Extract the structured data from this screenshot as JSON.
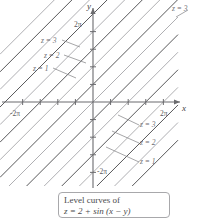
{
  "figure": {
    "background_color": "#ffffff"
  },
  "axes": {
    "x_axis_label": "x",
    "y_axis_label": "y",
    "x_ticks": [
      {
        "label": "-2π",
        "value": -6.2832
      },
      {
        "label": "",
        "value": -4.7124
      },
      {
        "label": "",
        "value": -3.1416
      },
      {
        "label": "",
        "value": -1.5708
      },
      {
        "label": "",
        "value": 1.5708
      },
      {
        "label": "",
        "value": 3.1416
      },
      {
        "label": "",
        "value": 4.7124
      },
      {
        "label": "2π",
        "value": 6.2832
      }
    ],
    "y_ticks": [
      {
        "label": "2π",
        "value": 6.2832
      },
      {
        "label": "",
        "value": 4.7124
      },
      {
        "label": "",
        "value": 3.1416
      },
      {
        "label": "",
        "value": 1.5708
      },
      {
        "label": "",
        "value": -1.5708
      },
      {
        "label": "",
        "value": -3.1416
      },
      {
        "label": "",
        "value": -4.7124
      },
      {
        "label": "-2π",
        "value": -6.2832
      }
    ],
    "axis_color": "#6b6b6e"
  },
  "contour_labels": {
    "upper_left": [
      {
        "text": "z = 3",
        "x": 41,
        "y": 40
      },
      {
        "text": "z = 2",
        "x": 44,
        "y": 55
      },
      {
        "text": "z = 1",
        "x": 33,
        "y": 68
      }
    ],
    "lower_right": [
      {
        "text": "z = 3",
        "x": 140,
        "y": 124
      },
      {
        "text": "z = 2",
        "x": 140,
        "y": 142
      },
      {
        "text": "z = 1",
        "x": 140,
        "y": 161
      }
    ],
    "top_right": [
      {
        "text": "z = 3",
        "x": 172,
        "y": 8
      }
    ]
  },
  "caption": {
    "line1": "Level curves of",
    "line2": "z = 2 + sin (x − y)"
  },
  "chart_data": {
    "type": "line",
    "function": "z = 2 + sin(x - y)",
    "xlabel": "x",
    "ylabel": "y",
    "xlim": [
      -8.6,
      8.6
    ],
    "ylim": [
      -8.6,
      8.6
    ],
    "grid": false,
    "legend": "inline-labels",
    "series": [
      {
        "name": "z = 1",
        "level": 1,
        "slope": 1,
        "intercepts": [
          -10.995,
          -4.712,
          1.571,
          7.854,
          14.137
        ],
        "color": "#58585a"
      },
      {
        "name": "z = 2",
        "level": 2,
        "slope": 1,
        "intercepts": [
          -9.425,
          -6.283,
          -3.142,
          0.0,
          3.142,
          6.283,
          9.425,
          12.566
        ],
        "color": "#a6a6a9"
      },
      {
        "name": "z = 3",
        "level": 3,
        "slope": 1,
        "intercepts": [
          -7.854,
          -1.571,
          4.712,
          10.996
        ],
        "color": "#58585a"
      }
    ],
    "lines": [
      {
        "intercept": -12.566,
        "level": 2,
        "color": "#a6a6a9"
      },
      {
        "intercept": -10.995,
        "level": 1,
        "color": "#58585a"
      },
      {
        "intercept": -9.425,
        "level": 2,
        "color": "#a6a6a9"
      },
      {
        "intercept": -7.854,
        "level": 3,
        "color": "#58585a"
      },
      {
        "intercept": -6.283,
        "level": 2,
        "color": "#a6a6a9"
      },
      {
        "intercept": -4.712,
        "level": 1,
        "color": "#58585a"
      },
      {
        "intercept": -3.142,
        "level": 2,
        "color": "#a6a6a9"
      },
      {
        "intercept": -1.571,
        "level": 3,
        "color": "#58585a"
      },
      {
        "intercept": 0.0,
        "level": 2,
        "color": "#a6a6a9"
      },
      {
        "intercept": 1.571,
        "level": 1,
        "color": "#58585a"
      },
      {
        "intercept": 3.142,
        "level": 2,
        "color": "#a6a6a9"
      },
      {
        "intercept": 4.712,
        "level": 3,
        "color": "#58585a"
      },
      {
        "intercept": 6.283,
        "level": 2,
        "color": "#a6a6a9"
      },
      {
        "intercept": 7.854,
        "level": 1,
        "color": "#58585a"
      },
      {
        "intercept": 9.425,
        "level": 2,
        "color": "#a6a6a9"
      },
      {
        "intercept": 10.996,
        "level": 3,
        "color": "#58585a"
      }
    ]
  }
}
